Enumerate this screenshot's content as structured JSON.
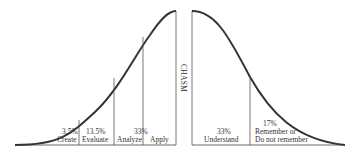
{
  "diagram": {
    "type": "adoption-curve-with-chasm",
    "divider_label": "CHASM",
    "left_segments": [
      {
        "percent": "3.5%",
        "label": "Create"
      },
      {
        "percent": "13.5%",
        "label": "Evaluate"
      },
      {
        "percent": "",
        "label": "Analyze"
      },
      {
        "percent": "33%",
        "label": "Apply"
      }
    ],
    "right_segments": [
      {
        "percent": "33%",
        "label": "Understand"
      },
      {
        "percent": "17%",
        "label": "Remember or",
        "label2": "Do not remember"
      }
    ]
  },
  "colors": {
    "line": "#333333",
    "divider": "#555555",
    "background": "#ffffff"
  }
}
